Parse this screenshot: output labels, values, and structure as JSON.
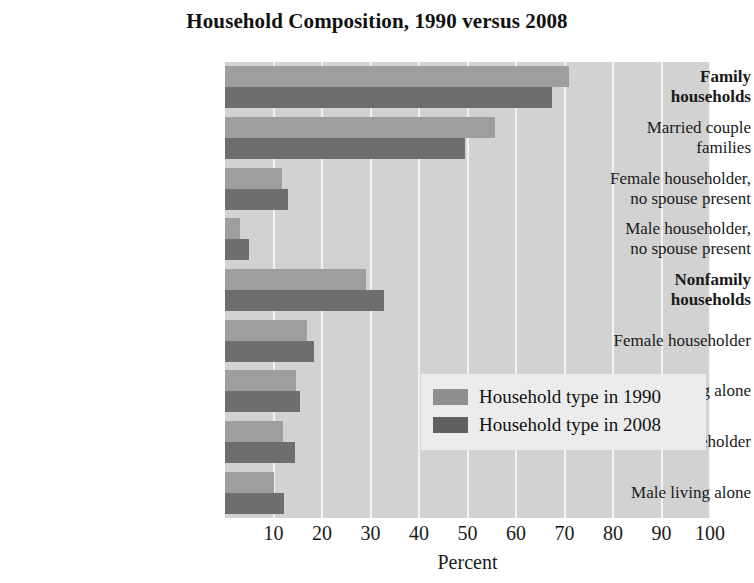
{
  "chart_data": {
    "type": "bar",
    "orientation": "horizontal",
    "title": "Household Composition, 1990 versus 2008",
    "xlabel": "Percent",
    "ylabel": "",
    "xlim": [
      0,
      100
    ],
    "xticks": [
      10,
      20,
      30,
      40,
      50,
      60,
      70,
      80,
      90,
      100
    ],
    "grid": true,
    "legend_position": "center-right",
    "categories": [
      "Family households",
      "Married couple families",
      "Female householder, no spouse present",
      "Male householder, no spouse present",
      "Nonfamily households",
      "Female householder",
      "Female living alone",
      "Male householder",
      "Male living alone"
    ],
    "category_lines": [
      [
        "Family",
        "households"
      ],
      [
        "Married couple",
        "families"
      ],
      [
        "Female householder,",
        "no spouse present"
      ],
      [
        "Male householder,",
        "no spouse present"
      ],
      [
        "Nonfamily",
        "households"
      ],
      [
        "Female householder"
      ],
      [
        "Female living alone"
      ],
      [
        "Male householder"
      ],
      [
        "Male living alone"
      ]
    ],
    "category_bold": [
      true,
      false,
      false,
      false,
      true,
      false,
      false,
      false,
      false
    ],
    "series": [
      {
        "name": "Household type in 1990",
        "color": "#9e9e9e",
        "values": [
          71.0,
          55.7,
          11.7,
          3.0,
          29.0,
          16.9,
          14.7,
          12.0,
          10.2
        ]
      },
      {
        "name": "Household type in 2008",
        "color": "#6e6e6e",
        "values": [
          67.5,
          49.5,
          12.9,
          4.9,
          32.8,
          18.3,
          15.4,
          14.4,
          12.1
        ]
      }
    ]
  },
  "legend": {
    "items": [
      {
        "label": "Household type in 1990",
        "swatch": "s1990"
      },
      {
        "label": "Household type in 2008",
        "swatch": "s2008"
      }
    ]
  },
  "colors": {
    "plot_background": "#d2d2d2",
    "gridline": "#f2f2f2",
    "series_1990": "#9e9e9e",
    "series_2008": "#6e6e6e",
    "legend_background": "#ececec",
    "text": "#1a1a1a"
  }
}
